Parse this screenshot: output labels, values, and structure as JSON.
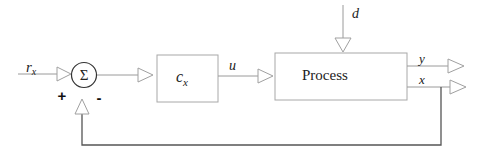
{
  "diagram": {
    "type": "block-diagram",
    "title": "",
    "colors": {
      "line": "#9a9a9a",
      "feedback_line": "#555555",
      "box_border": "#a0a0a0",
      "text": "#222222",
      "background": "#ffffff"
    },
    "signals": {
      "reference": "r",
      "reference_sub": "x",
      "control": "u",
      "disturbance": "d",
      "output_y": "y",
      "output_x": "x"
    },
    "summing_junction": {
      "symbol": "Σ",
      "plus_sign": "+",
      "minus_sign": "-"
    },
    "blocks": {
      "controller": {
        "label": "c",
        "label_sub": "x"
      },
      "process": {
        "label": "Process"
      }
    }
  }
}
